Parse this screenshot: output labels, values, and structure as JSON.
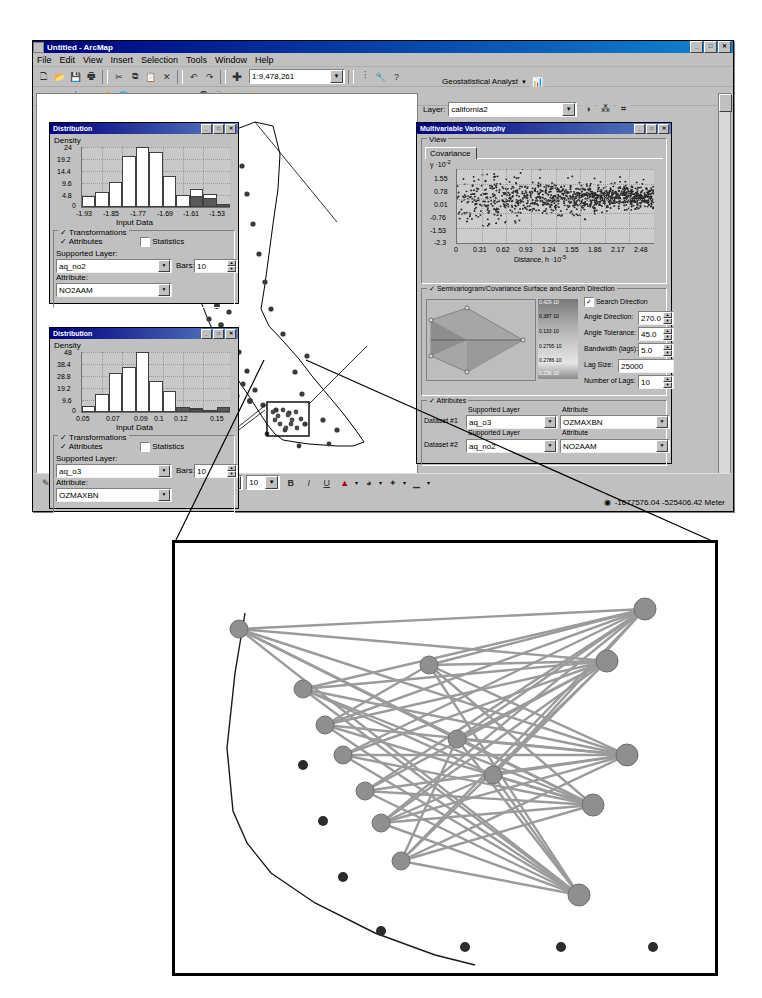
{
  "app": {
    "title": "Untitled - ArcMap",
    "window_buttons": [
      "_",
      "□",
      "✕"
    ],
    "menu": [
      "File",
      "Edit",
      "View",
      "Insert",
      "Selection",
      "Tools",
      "Window",
      "Help"
    ],
    "scale_value": "1:9,478,261",
    "geostat_toolbar_label": "Geostatistical Analyst",
    "layer_label": "Layer:",
    "layer_value": "california2",
    "status_coords": "-1677576.04  -525406.42  Meter",
    "draw_font_size": "10",
    "draw_buttons": [
      "B",
      "I",
      "U"
    ]
  },
  "histogram1": {
    "title": "Distribution",
    "window_buttons": [
      "_",
      "□",
      "✕"
    ],
    "y_axis_title": "Density",
    "x_axis_title": "Input Data",
    "chart_data": {
      "type": "bar",
      "title": "Distribution",
      "xlabel": "Input Data",
      "ylabel": "Density",
      "categories": [
        "-1.93",
        "-1.89",
        "-1.85",
        "-1.81",
        "-1.77",
        "-1.73",
        "-1.69",
        "-1.65",
        "-1.61",
        "-1.57",
        "-1.53"
      ],
      "xticks": [
        "-1.93",
        "-1.85",
        "-1.77",
        "-1.69",
        "-1.61",
        "-1.53"
      ],
      "yticks": [
        "0",
        "4.8",
        "9.6",
        "14.4",
        "19.2",
        "24"
      ],
      "ylim": [
        0,
        24
      ],
      "values": [
        4.3,
        6.2,
        10.0,
        20.5,
        24.0,
        22.0,
        12.5,
        5.0,
        7.2,
        5.4,
        1.2
      ],
      "selected_bars": [
        8,
        9,
        10
      ],
      "grid": true
    },
    "transformations_label": "Transformations",
    "attributes_label": "Attributes",
    "statistics_label": "Statistics",
    "statistics_checked": false,
    "supported_layer_label": "Supported Layer:",
    "supported_layer_value": "aq_no2",
    "attribute_label": "Attribute:",
    "attribute_value": "NO2AAM",
    "bars_label": "Bars:",
    "bars_value": "10"
  },
  "histogram2": {
    "title": "Distribution",
    "window_buttons": [
      "_",
      "□",
      "✕"
    ],
    "y_axis_title": "Density",
    "x_axis_title": "Input Data",
    "chart_data": {
      "type": "bar",
      "title": "Distribution",
      "xlabel": "Input Data",
      "ylabel": "Density",
      "categories": [
        "0.05",
        "0.06",
        "0.07",
        "0.08",
        "0.09",
        "0.10",
        "0.11",
        "0.12",
        "0.13",
        "0.14",
        "0.15"
      ],
      "xticks": [
        "0.05",
        "0.07",
        "0.09",
        "0.1",
        "0.12",
        "0.15"
      ],
      "yticks": [
        "0",
        "9.6",
        "19.2",
        "28.8",
        "38.4",
        "48"
      ],
      "ylim": [
        0,
        48
      ],
      "values": [
        4.5,
        14.0,
        31.0,
        36.0,
        48.0,
        25.0,
        17.0,
        3.0,
        2.0,
        2.0,
        4.0
      ],
      "selected_bars": [
        7,
        8,
        9,
        10
      ],
      "grid": true
    },
    "transformations_label": "Transformations",
    "attributes_label": "Attributes",
    "statistics_label": "Statistics",
    "statistics_checked": false,
    "supported_layer_label": "Supported Layer:",
    "supported_layer_value": "aq_o3",
    "attribute_label": "Attribute:",
    "attribute_value": "OZMAXBN",
    "bars_label": "Bars:",
    "bars_value": "10"
  },
  "variography": {
    "title": "Multivariable Variography",
    "window_buttons": [
      "_",
      "□",
      "✕"
    ],
    "view_group_label": "View",
    "tab_label": "Covariance",
    "y_axis_title": "γ ·10",
    "y_axis_exp": "-2",
    "x_axis_title": "Distance, h ·10",
    "x_axis_exp": "-5",
    "chart_data": {
      "type": "scatter",
      "title": "Covariance",
      "xlabel": "Distance, h ·10⁻⁵",
      "ylabel": "γ ·10⁻²",
      "xticks": [
        "0",
        "0.31",
        "0.62",
        "0.93",
        "1.24",
        "1.55",
        "1.86",
        "2.17",
        "2.48"
      ],
      "yticks": [
        "1.55",
        "0.78",
        "0.01",
        "-0.76",
        "-1.53",
        "-2.3"
      ],
      "xlim": [
        0,
        2.48
      ],
      "ylim": [
        -2.3,
        1.55
      ],
      "n_points": 1100,
      "grid": true,
      "description": "Dense cloud of empirical covariance pairs, highest spread near the origin, converging toward 0.01 with distance"
    },
    "surface_group_label": "Semivariogram/Covariance Surface and Search Direction",
    "search_direction_label": "Search Direction",
    "search_direction_checked": true,
    "angle_direction_label": "Angle Direction:",
    "angle_direction_value": "270.0",
    "angle_tolerance_label": "Angle Tolerance:",
    "angle_tolerance_value": "45.0",
    "bandwidth_label": "Bandwidth (lags):",
    "bandwidth_value": "5.0",
    "lag_size_label": "Lag Size:",
    "lag_size_value": "25000",
    "number_of_lags_label": "Number of Lags:",
    "number_of_lags_value": "10",
    "legend_values": [
      "0.429·10",
      "0.387·10",
      "0.133·10",
      "0.2795·10",
      "0.2786·10",
      "0.236·10"
    ],
    "attributes_group_label": "Attributes",
    "dataset1_label": "Dataset #1",
    "dataset2_label": "Dataset #2",
    "supported_layer_header": "Supported Layer",
    "attribute_header": "Attribute",
    "dataset1_layer": "aq_o3",
    "dataset1_attribute": "OZMAXBN",
    "dataset2_layer": "aq_no2",
    "dataset2_attribute": "NO2AAM"
  },
  "map": {
    "description": "California state outline with air quality monitoring station points; dense cluster in Los Angeles basin",
    "selection_box_label": "selection extent"
  },
  "inset": {
    "description": "Magnified view of Los Angeles basin: selected monitoring stations connected by search-direction pair lines",
    "node_color": "#8a8a8a",
    "line_color": "#9a9a9a",
    "unselected_color": "#404040"
  },
  "colors": {
    "window_face": "#c0c0c0",
    "title_active": "#000080",
    "plot_face": "#c9c9c9",
    "bar_fill": "#ffffff",
    "bar_selected": "#585858"
  }
}
